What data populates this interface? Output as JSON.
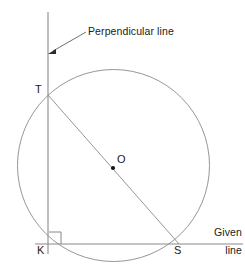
{
  "figure": {
    "stroke_color": "#6f6f6f",
    "accent_color": "#3a3a3a",
    "text_color": "#1a1a1a",
    "background": "#ffffff",
    "width": 245,
    "height": 279
  },
  "labels": {
    "point_t": "T",
    "point_o": "O",
    "point_k": "K",
    "point_s": "S",
    "perpendicular": "Perpendicular line",
    "given_line_top": "Given",
    "given_line_bottom": "line"
  },
  "geometry": {
    "circle": {
      "cx": 113.5,
      "cy": 165.5,
      "r": 96
    },
    "points": {
      "T": {
        "x": 48,
        "y": 95
      },
      "O": {
        "x": 113,
        "y": 168
      },
      "K": {
        "x": 48,
        "y": 244
      },
      "S": {
        "x": 179,
        "y": 244
      }
    },
    "perpendicular_line": {
      "x1": 48,
      "y1": 12,
      "x2": 48,
      "y2": 254
    },
    "given_line": {
      "x1": 35,
      "y1": 244,
      "x2": 243,
      "y2": 244
    },
    "diameter_ts": {
      "x1": 48,
      "y1": 95,
      "x2": 179,
      "y2": 244
    },
    "right_angle_marker": {
      "x": 49,
      "y": 232,
      "size": 12
    },
    "callout_arrow": {
      "x1": 86,
      "y1": 32,
      "x2": 50,
      "y2": 53
    }
  }
}
